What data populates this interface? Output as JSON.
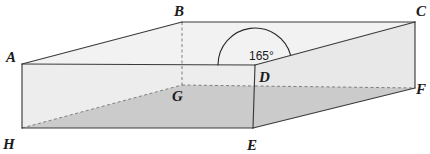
{
  "figure": {
    "type": "3d-solid-diagram",
    "canvas": {
      "width": 430,
      "height": 154,
      "background": "#ffffff"
    },
    "colors": {
      "outline": "#3a3a3a",
      "hidden_edge": "#8a8a8a",
      "top_face_fill": "#f2f2f2",
      "front_face_fill": "#ededed",
      "right_face_fill": "#e8e8e8",
      "inclined_plane_fill": "#c9c9c9",
      "label_text": "#1a1a1a"
    },
    "vertices": [
      {
        "name": "A",
        "x": 22,
        "y": 64,
        "label_x": 10,
        "label_y": 60,
        "hidden": false
      },
      {
        "name": "B",
        "x": 182,
        "y": 22,
        "label_x": 176,
        "label_y": 15,
        "hidden": false
      },
      {
        "name": "C",
        "x": 415,
        "y": 22,
        "label_x": 418,
        "label_y": 15,
        "hidden": false
      },
      {
        "name": "D",
        "x": 255,
        "y": 65,
        "label_x": 261,
        "label_y": 82,
        "hidden": false
      },
      {
        "name": "E",
        "x": 253,
        "y": 128,
        "label_x": 248,
        "label_y": 149,
        "hidden": false
      },
      {
        "name": "F",
        "x": 415,
        "y": 88,
        "label_x": 417,
        "label_y": 94,
        "hidden": false
      },
      {
        "name": "G",
        "x": 182,
        "y": 85,
        "label_x": 174,
        "label_y": 101,
        "hidden": true
      },
      {
        "name": "H",
        "x": 22,
        "y": 128,
        "label_x": 6,
        "label_y": 148,
        "hidden": false
      }
    ],
    "solid_edges": [
      {
        "name": "edge-AB",
        "from": "A",
        "to": "B"
      },
      {
        "name": "edge-BC",
        "from": "B",
        "to": "C"
      },
      {
        "name": "edge-CD",
        "from": "C",
        "to": "D"
      },
      {
        "name": "edge-AD",
        "from": "A",
        "to": "D"
      },
      {
        "name": "edge-CF",
        "from": "C",
        "to": "F"
      },
      {
        "name": "edge-DE",
        "from": "D",
        "to": "E"
      },
      {
        "name": "edge-AH",
        "from": "A",
        "to": "H"
      },
      {
        "name": "edge-HE",
        "from": "H",
        "to": "E"
      },
      {
        "name": "edge-EF",
        "from": "E",
        "to": "F"
      }
    ],
    "dashed_edges": [
      {
        "name": "edge-BG",
        "from": "B",
        "to": "G"
      },
      {
        "name": "edge-GD",
        "from": "G",
        "to": "D"
      },
      {
        "name": "edge-DF",
        "from": "D",
        "to": "F"
      },
      {
        "name": "edge-HG",
        "from": "H",
        "to": "G"
      }
    ],
    "faces": [
      {
        "name": "top-face-ABCD",
        "points": "22,64 182,22 415,22 255,65",
        "fill_key": "top_face_fill"
      },
      {
        "name": "front-face-ADEH",
        "points": "22,64 255,65 253,128 22,128",
        "fill_key": "front_face_fill"
      },
      {
        "name": "right-face-DCFE",
        "points": "255,65 415,22 415,88 253,128",
        "fill_key": "right_face_fill"
      },
      {
        "name": "inclined-plane-HGDFE",
        "points": "22,128 182,85 255,86 415,88 253,128",
        "fill_key": "inclined_plane_fill"
      }
    ],
    "angle_annotation": {
      "name": "angle-at-D",
      "value": "165°",
      "vertex": "D",
      "text_x": 265,
      "text_y": 57,
      "arc_center_x": 255,
      "arc_center_y": 65,
      "arc_radius": 37
    }
  }
}
